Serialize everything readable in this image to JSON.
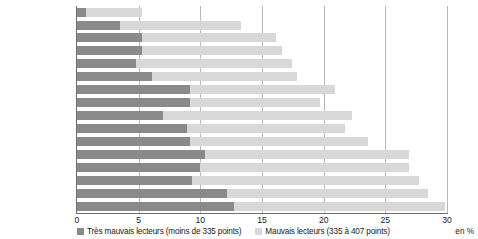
{
  "chart_data": {
    "type": "bar",
    "orientation": "horizontal",
    "stacked": true,
    "title": "",
    "xlabel": "en %",
    "ylabel": "",
    "xlim": [
      0,
      30
    ],
    "xticks": [
      0,
      5,
      10,
      15,
      20,
      25,
      30
    ],
    "grid": true,
    "legend_position": "bottom",
    "categories": [
      "Finlande",
      "Irlande",
      "Pays-Bas",
      "Suède",
      "Danemark",
      "Pologne",
      "Belgique",
      "Allemagne",
      "Hongrie",
      "Autriche",
      "France",
      "République tchèque",
      "Portugal",
      "Espagne",
      "Italie",
      "Grèce"
    ],
    "highlight_category": "France",
    "series": [
      {
        "name": "Très mauvais lecteurs (moins de 335 points)",
        "color": "#8a8a8a",
        "values": [
          0.7,
          3.5,
          5.3,
          5.3,
          4.8,
          6.1,
          9.2,
          9.2,
          7.0,
          8.9,
          9.2,
          10.4,
          10.0,
          9.3,
          12.2,
          12.7
        ]
      },
      {
        "name": "Mauvais lecteurs (335  à 407 points)",
        "color": "#d8d8d8",
        "values": [
          4.6,
          9.8,
          10.8,
          11.3,
          12.6,
          11.7,
          11.7,
          10.5,
          15.3,
          12.8,
          14.4,
          16.5,
          16.9,
          18.4,
          16.3,
          17.1
        ]
      }
    ],
    "totals": [
      5.3,
      13.3,
      16.1,
      16.6,
      17.4,
      17.8,
      20.9,
      19.7,
      22.3,
      21.7,
      23.6,
      26.9,
      26.9,
      27.7,
      28.5,
      29.8
    ]
  },
  "axis": {
    "unit_label": "en %"
  }
}
